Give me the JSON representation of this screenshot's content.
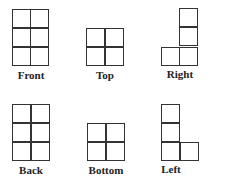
{
  "diagram": {
    "views": [
      {
        "label": "Front",
        "cells": [
          [
            12,
            9
          ],
          [
            30,
            9
          ],
          [
            12,
            28
          ],
          [
            30,
            28
          ],
          [
            12,
            47
          ],
          [
            30,
            47
          ]
        ],
        "label_x": 0,
        "label_y": 69
      },
      {
        "label": "Top",
        "cells": [
          [
            86,
            28
          ],
          [
            105,
            28
          ],
          [
            86,
            47
          ],
          [
            105,
            47
          ]
        ],
        "label_x": 75,
        "label_y": 69
      },
      {
        "label": "Right",
        "cells": [
          [
            179,
            8
          ],
          [
            179,
            27
          ],
          [
            161,
            47
          ],
          [
            179,
            47
          ]
        ],
        "label_x": 150,
        "label_y": 68
      },
      {
        "label": "Back",
        "cells": [
          [
            12,
            104
          ],
          [
            31,
            104
          ],
          [
            12,
            123
          ],
          [
            31,
            123
          ],
          [
            12,
            142
          ],
          [
            31,
            142
          ]
        ],
        "label_x": 1,
        "label_y": 164
      },
      {
        "label": "Bottom",
        "cells": [
          [
            87,
            123
          ],
          [
            106,
            123
          ],
          [
            87,
            142
          ],
          [
            106,
            142
          ]
        ],
        "label_x": 76,
        "label_y": 164
      },
      {
        "label": "Left",
        "cells": [
          [
            161,
            104
          ],
          [
            161,
            123
          ],
          [
            161,
            142
          ],
          [
            180,
            142
          ]
        ],
        "label_x": 141,
        "label_y": 163
      }
    ],
    "colors": {
      "line": "#333333",
      "label": "#222222",
      "background": "#ffffff"
    }
  }
}
